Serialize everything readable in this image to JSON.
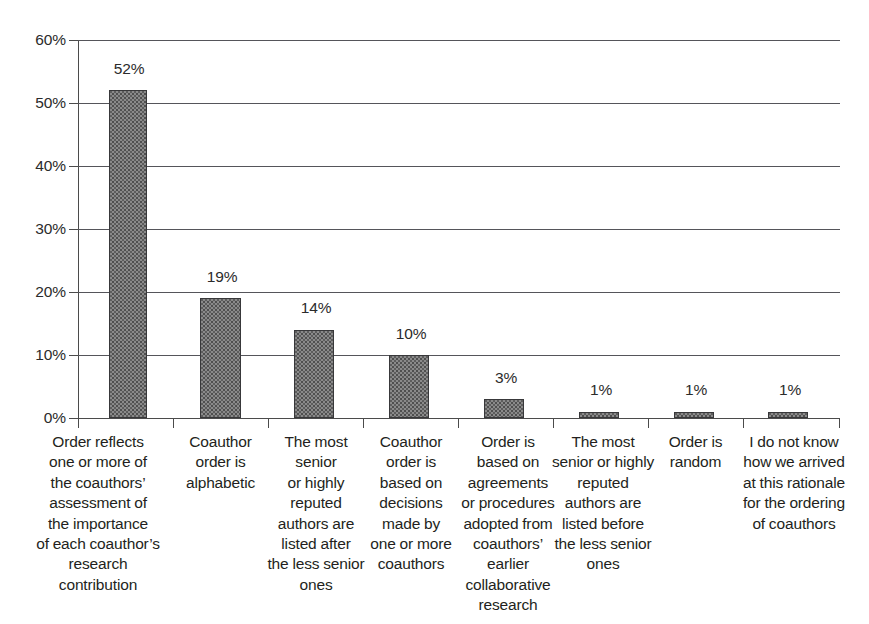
{
  "chart_data": {
    "type": "bar",
    "title": "",
    "subtitle": "",
    "xlabel": "",
    "ylabel": "",
    "ylim": [
      0,
      60
    ],
    "grid": true,
    "legend": null,
    "y_ticks": [
      "0%",
      "10%",
      "20%",
      "30%",
      "40%",
      "50%",
      "60%"
    ],
    "y_tick_values": [
      0,
      10,
      20,
      30,
      40,
      50,
      60
    ],
    "value_suffix": "%",
    "categories": [
      "Order reflects one or more of the coauthors’ assessment of the importance of each coauthor’s research contribution",
      "Coauthor order is alphabetic",
      "The most senior or highly reputed authors are listed after the less senior ones",
      "Coauthor order is based on decisions made by one or more coauthors",
      "Order is based on agreements or procedures adopted from coauthors’ earlier collaborative research",
      "The most senior or highly reputed authors are listed before the less senior ones",
      "Order is random",
      "I do not know how we arrived at this rationale for the ordering of coauthors"
    ],
    "category_lines": [
      [
        "Order reflects",
        "one or more of",
        "the coauthors’",
        "assessment of",
        "the importance",
        "of each coauthor’s",
        "research",
        "contribution"
      ],
      [
        "Coauthor",
        "order is",
        "alphabetic"
      ],
      [
        "The most",
        "senior",
        "or highly",
        "reputed",
        "authors are",
        "listed after",
        "the less senior",
        "ones"
      ],
      [
        "Coauthor",
        "order is",
        "based on",
        "decisions",
        "made by",
        "one or more",
        "coauthors"
      ],
      [
        "Order is",
        "based on",
        "agreements",
        "or procedures",
        "adopted from",
        "coauthors’",
        "earlier",
        "collaborative",
        "research"
      ],
      [
        "The most",
        "senior or highly",
        "reputed",
        "authors are",
        "listed before",
        "the less senior",
        "ones"
      ],
      [
        "Order is",
        "random"
      ],
      [
        "I do not know",
        "how we arrived",
        "at this rationale",
        "for the ordering",
        "of coauthors"
      ]
    ],
    "values": [
      52,
      19,
      14,
      10,
      3,
      1,
      1,
      1
    ],
    "data_labels": [
      "52%",
      "19%",
      "14%",
      "10%",
      "3%",
      "1%",
      "1%",
      "1%"
    ]
  },
  "style": {
    "bar_fill": "#8a8a8a",
    "bar_border": "#38383a",
    "gridline_color": "#55555a",
    "axis_color": "#4b4b4b",
    "text_color": "#231f20",
    "background": "#ffffff"
  }
}
